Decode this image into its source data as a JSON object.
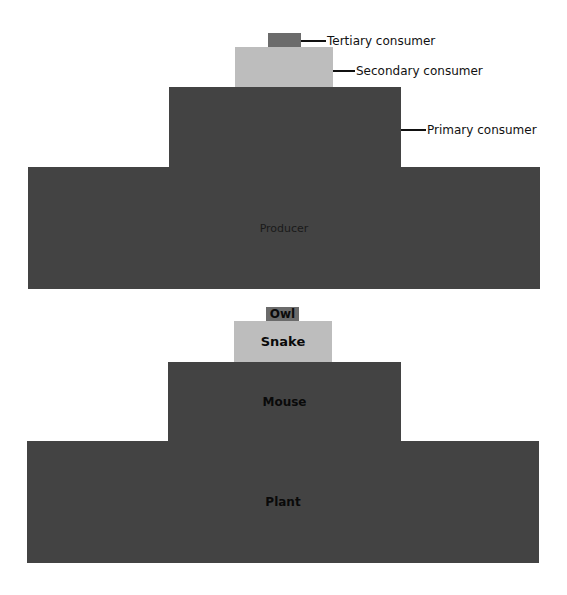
{
  "top_pyramid": {
    "levels": [
      {
        "id": "tertiary",
        "label": "Tertiary consumer",
        "box_text": ""
      },
      {
        "id": "secondary",
        "label": "Secondary consumer",
        "box_text": ""
      },
      {
        "id": "primary",
        "label": "Primary consumer",
        "box_text": ""
      },
      {
        "id": "producer",
        "label": "",
        "box_text": "Producer"
      }
    ]
  },
  "bottom_pyramid": {
    "levels": [
      {
        "id": "owl",
        "box_text": "Owl"
      },
      {
        "id": "snake",
        "box_text": "Snake"
      },
      {
        "id": "mouse",
        "box_text": "Mouse"
      },
      {
        "id": "plant",
        "box_text": "Plant"
      }
    ]
  },
  "colors": {
    "dark": "#434343",
    "light": "#bdbdbd",
    "mid": "#6b6b6b",
    "background": "#ffffff"
  }
}
